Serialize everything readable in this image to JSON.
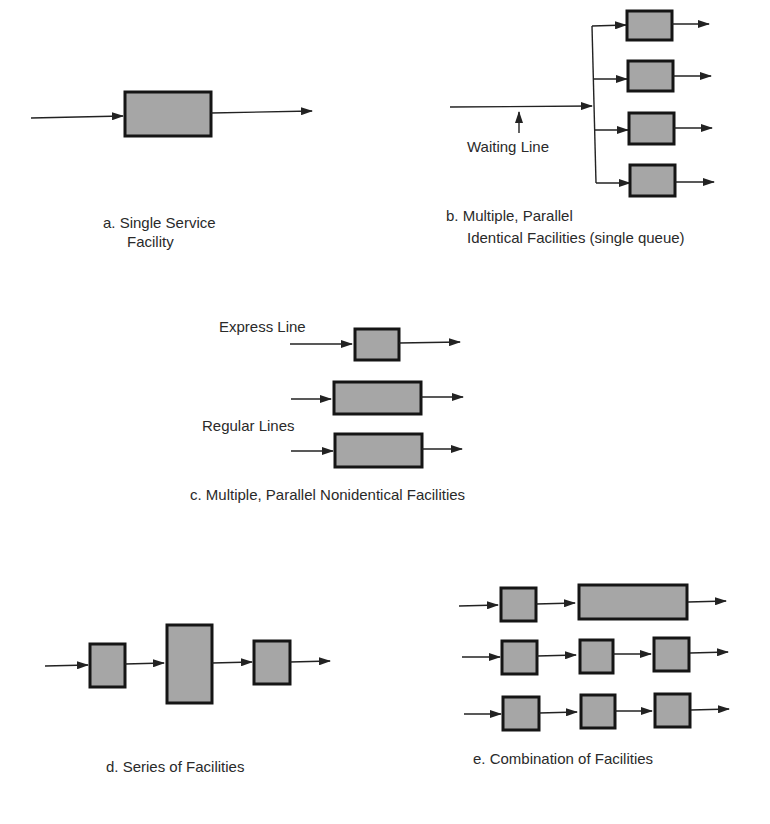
{
  "colors": {
    "box_fill": "#a6a6a6",
    "box_stroke": "#151515",
    "line": "#222222",
    "text": "#2a2a2a",
    "background": "#ffffff"
  },
  "panels": {
    "a": {
      "caption_line1": "a.  Single Service",
      "caption_line2": "Facility"
    },
    "b": {
      "annotation": "Waiting Line",
      "caption_line1": "b.   Multiple, Parallel",
      "caption_line2": "Identical Facilities (single queue)"
    },
    "c": {
      "express_label": "Express Line",
      "regular_label": "Regular Lines",
      "caption": "c.  Multiple, Parallel Nonidentical Facilities"
    },
    "d": {
      "caption": "d.  Series of Facilities"
    },
    "e": {
      "caption": "e.  Combination of Facilities"
    }
  }
}
